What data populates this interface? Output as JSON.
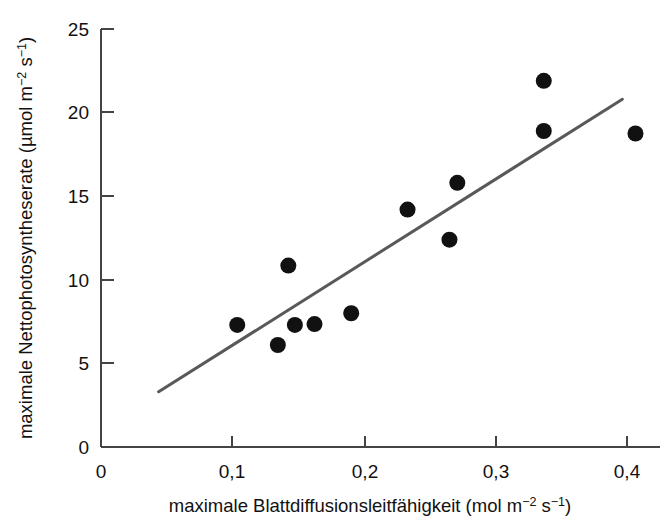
{
  "chart_data": {
    "type": "scatter",
    "title": "",
    "xlabel": "maximale Blattdiffusionsleitfähigkeit (mol m⁻² s⁻¹)",
    "ylabel": "maximale Nettophotosyntheserate (µmol m⁻² s⁻¹)",
    "xlim": [
      0,
      0.44
    ],
    "ylim": [
      0,
      25
    ],
    "grid": false,
    "legend": null,
    "xticks": [
      0,
      0.1,
      0.2,
      0.3,
      0.4
    ],
    "xticklabels": [
      "0",
      "0,1",
      "0,2",
      "0,3",
      "0,4"
    ],
    "yticks": [
      0,
      5,
      10,
      15,
      20,
      25
    ],
    "yticklabels": [
      "0",
      "5",
      "10",
      "15",
      "20",
      "25"
    ],
    "marker_color": "#111111",
    "line_color": "#595959",
    "axis_color": "#444444",
    "points": [
      {
        "x": 0.104,
        "y": 7.3
      },
      {
        "x": 0.135,
        "y": 6.1
      },
      {
        "x": 0.143,
        "y": 10.85
      },
      {
        "x": 0.148,
        "y": 7.3
      },
      {
        "x": 0.163,
        "y": 7.35
      },
      {
        "x": 0.191,
        "y": 8.0
      },
      {
        "x": 0.234,
        "y": 14.2
      },
      {
        "x": 0.266,
        "y": 12.4
      },
      {
        "x": 0.272,
        "y": 15.8
      },
      {
        "x": 0.338,
        "y": 21.9
      },
      {
        "x": 0.338,
        "y": 18.9
      },
      {
        "x": 0.408,
        "y": 18.75
      }
    ],
    "trendline": {
      "name": "Regressionsgerade",
      "x0": 0.044,
      "y0": 3.3,
      "x1": 0.398,
      "y1": 20.8
    }
  },
  "axis_labels": {
    "y_main": "maximale Nettophotosyntheserate (",
    "y_unit_mu": "µmol m",
    "y_unit_sup1": "−2",
    "y_unit_mid": " s",
    "y_unit_sup2": "−1",
    "y_unit_close": ")",
    "x_main": "maximale Blattdiffusionsleitfähigkeit (",
    "x_unit": "mol m",
    "x_unit_sup1": "−2",
    "x_unit_mid": " s",
    "x_unit_sup2": "−1",
    "x_unit_close": ")"
  }
}
